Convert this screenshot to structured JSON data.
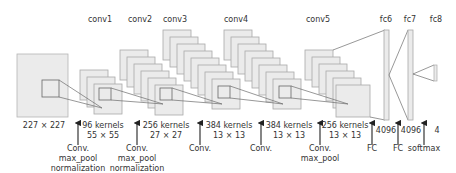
{
  "colors": {
    "sheet_fill": "#ebebeb",
    "sheet_stroke": "#a9a9a9",
    "line": "#6b6b6b",
    "text": "#333333",
    "arrow": "#222222"
  },
  "layers": [
    {
      "id": "input",
      "name": "",
      "size": "227 × 227"
    },
    {
      "id": "conv1",
      "name": "conv1",
      "kernels": "96 kernels",
      "size": "55 × 55",
      "ops": "Conv.\nmax_pool\nnormalization"
    },
    {
      "id": "conv2",
      "name": "conv2",
      "kernels": "256 kernels",
      "size": "27 × 27",
      "ops": "Conv.\nmax_pool\nnormalization"
    },
    {
      "id": "conv3",
      "name": "conv3",
      "kernels": "384 kernels",
      "size": "13 × 13",
      "ops": "Conv."
    },
    {
      "id": "conv4",
      "name": "conv4",
      "kernels": "384 kernels",
      "size": "13 × 13",
      "ops": "Conv."
    },
    {
      "id": "conv5",
      "name": "conv5",
      "kernels": "256 kernels",
      "size": "13 × 13",
      "ops": "Conv.\nmax_pool"
    },
    {
      "id": "fc6",
      "name": "fc6",
      "units": "4096",
      "ops": "FC"
    },
    {
      "id": "fc7",
      "name": "fc7",
      "units": "4096",
      "ops": "FC"
    },
    {
      "id": "fc8",
      "name": "fc8",
      "units": "4",
      "ops": "softmax"
    }
  ],
  "labels": {
    "input_size": "227 × 227",
    "conv1_name": "conv1",
    "conv2_name": "conv2",
    "conv3_name": "conv3",
    "conv4_name": "conv4",
    "conv5_name": "conv5",
    "fc6_name": "fc6",
    "fc7_name": "fc7",
    "fc8_name": "fc8",
    "conv1_info": "96 kernels\n55 × 55",
    "conv2_info": "256 kernels\n27 × 27",
    "conv3_info": "384 kernels\n13 × 13",
    "conv4_info": "384 kernels\n13 × 13",
    "conv5_info": "256 kernels\n13 × 13",
    "fc6_units": "4096",
    "fc7_units": "4096",
    "fc8_units": "4",
    "op1": "Conv.\nmax_pool\nnormalization",
    "op2": "Conv.\nmax_pool\nnormalization",
    "op3": "Conv.",
    "op4": "Conv.",
    "op5": "Conv.\nmax_pool",
    "op6": "FC",
    "op7": "FC",
    "op8": "softmax"
  }
}
